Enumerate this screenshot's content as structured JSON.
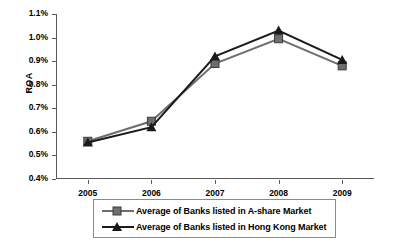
{
  "chart_data": {
    "type": "line",
    "title": "",
    "xlabel": "",
    "ylabel": "ROA",
    "categories": [
      "2005",
      "2006",
      "2007",
      "2008",
      "2009"
    ],
    "ylim": [
      0.4,
      1.1
    ],
    "ytick_labels": [
      "1.1%",
      "1.0%",
      "0.9%",
      "0.8%",
      "0.7%",
      "0.6%",
      "0.5%",
      "0.4%"
    ],
    "ytick_values": [
      1.1,
      1.0,
      0.9,
      0.8,
      0.7,
      0.6,
      0.5,
      0.4
    ],
    "grid": false,
    "legend_position": "bottom",
    "series": [
      {
        "name": "Average of Banks listed in A-share Market",
        "marker": "square",
        "color": "#6e6e6e",
        "values": [
          0.56,
          0.645,
          0.89,
          0.995,
          0.88
        ]
      },
      {
        "name": "Average of Banks listed in Hong Kong Market",
        "marker": "triangle",
        "color": "#1a1a1a",
        "values": [
          0.555,
          0.62,
          0.92,
          1.03,
          0.905
        ]
      }
    ]
  },
  "axis": {
    "y_title": "ROA"
  },
  "legend": {
    "items": [
      {
        "label": "Average of Banks listed in A-share Market"
      },
      {
        "label": "Average of Banks listed in Hong Kong Market"
      }
    ]
  }
}
